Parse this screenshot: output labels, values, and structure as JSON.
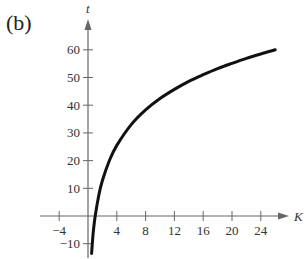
{
  "panel_label": "(b)",
  "chart_data": {
    "type": "line",
    "title": "",
    "xlabel": "K",
    "ylabel": "t",
    "xlim": [
      -6,
      28
    ],
    "ylim": [
      -14,
      66
    ],
    "x_ticks": [
      -4,
      4,
      8,
      12,
      16,
      20,
      24
    ],
    "y_ticks": [
      -10,
      10,
      20,
      30,
      40,
      50,
      60
    ],
    "x_tick_labels": [
      "−4",
      "4",
      "8",
      "12",
      "16",
      "20",
      "24"
    ],
    "y_tick_labels": [
      "−10",
      "10",
      "20",
      "30",
      "40",
      "50",
      "60"
    ],
    "grid": false,
    "legend": "none",
    "series": [
      {
        "name": "t(K)",
        "color": "#111111",
        "x": [
          0.5,
          0.6,
          0.75,
          1,
          1.5,
          2,
          3,
          4,
          6,
          8,
          10,
          12,
          14,
          16,
          18,
          20,
          22,
          24,
          26
        ],
        "y": [
          -13.5,
          -9.9,
          -5.3,
          0,
          7.5,
          12.8,
          20.2,
          25.5,
          33.0,
          38.3,
          42.4,
          45.7,
          48.6,
          51.0,
          53.2,
          55.1,
          56.9,
          58.5,
          60.0
        ]
      }
    ]
  }
}
